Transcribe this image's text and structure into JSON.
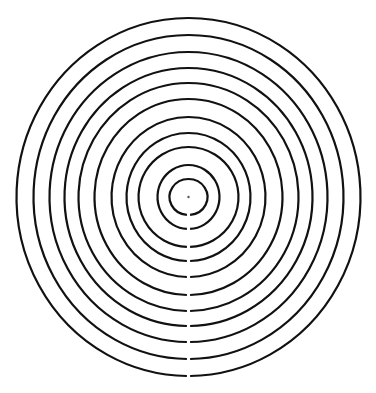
{
  "diagram": {
    "type": "concentric-circle-maze",
    "canvas": {
      "width": 376,
      "height": 393,
      "background": "#ffffff"
    },
    "center": {
      "x": 188.5,
      "y": 197
    },
    "center_dot": {
      "radius": 1.2,
      "color": "#555555"
    },
    "stroke": {
      "color": "#111111",
      "width": 2.2
    },
    "gap": {
      "position": "bottom",
      "x": 189,
      "half_width": 1.6
    },
    "rings": [
      {
        "rx": 19,
        "ry": 18
      },
      {
        "rx": 31,
        "ry": 32
      },
      {
        "rx": 50,
        "ry": 50
      },
      {
        "rx": 62,
        "ry": 64
      },
      {
        "rx": 77,
        "ry": 80
      },
      {
        "rx": 94,
        "ry": 98
      },
      {
        "rx": 110,
        "ry": 114
      },
      {
        "rx": 124,
        "ry": 129
      },
      {
        "rx": 139,
        "ry": 145
      },
      {
        "rx": 155,
        "ry": 162
      },
      {
        "rx": 172,
        "ry": 179
      }
    ]
  }
}
